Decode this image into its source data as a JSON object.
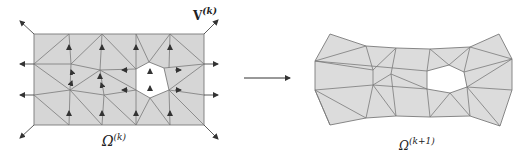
{
  "figure": {
    "left_panel": {
      "label_domain": "Ω",
      "label_domain_sup": "(k)",
      "label_velocity": "V",
      "label_velocity_sup": "(k)"
    },
    "right_panel": {
      "label_domain": "Ω",
      "label_domain_sup": "(k+1)"
    },
    "transition_arrow": "→"
  },
  "colors": {
    "mesh_fill": "#d6d6d6",
    "mesh_fill_right": "#dcdcdc",
    "mesh_edge": "#7a7a7a",
    "arrow": "#333333",
    "hole": "#ffffff"
  }
}
